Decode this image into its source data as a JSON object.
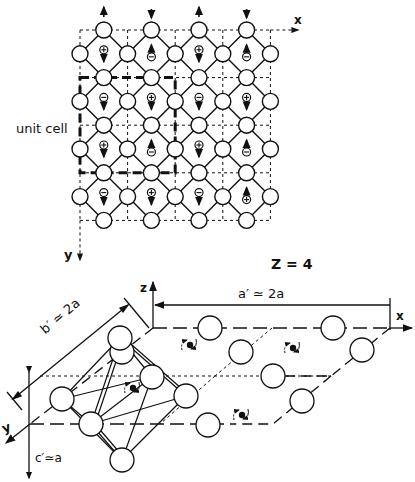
{
  "figure": {
    "top_panel": {
      "title": "2D lattice projection",
      "label_unit_cell": "unit cell",
      "axis_x": "x",
      "axis_y": "y",
      "grid": {
        "origin_x": 80,
        "origin_y": 30,
        "step": 47.6,
        "cols": 4,
        "rows": 4
      },
      "ion_charges": [
        [
          "+",
          "-",
          "+",
          "-"
        ],
        [
          "-",
          "+",
          "-",
          "+"
        ],
        [
          "+",
          "-",
          "+",
          "-"
        ],
        [
          "-",
          "+",
          "-",
          "+"
        ]
      ],
      "spin_directions": [
        [
          "down",
          "up",
          "down",
          "up"
        ],
        [
          "down",
          "down",
          "down",
          "down"
        ],
        [
          "down",
          "up",
          "down",
          "up"
        ],
        [
          "down",
          "down",
          "down",
          "up"
        ]
      ]
    },
    "formula_units": "Z = 4",
    "bottom_panel": {
      "title": "3D perspective cell",
      "axis_x": "x",
      "axis_y": "y",
      "axis_z": "z",
      "dim_a": "a′ ≃ 2a",
      "dim_b": "b′ ≃ 2a",
      "dim_c": "c′≃a"
    },
    "colors": {
      "ink": "#111111",
      "background": "#ffffff"
    }
  }
}
